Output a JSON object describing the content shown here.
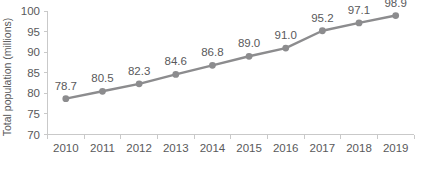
{
  "chart_data": {
    "type": "line",
    "title": "",
    "subtitle": "",
    "xlabel": "",
    "ylabel": "Total population (millions)",
    "categories": [
      "2010",
      "2011",
      "2012",
      "2013",
      "2014",
      "2015",
      "2016",
      "2017",
      "2018",
      "2019"
    ],
    "values": [
      78.7,
      80.5,
      82.3,
      84.6,
      86.8,
      89.0,
      91.0,
      95.2,
      97.1,
      98.9
    ],
    "point_labels": [
      "78.7",
      "80.5",
      "82.3",
      "84.6",
      "86.8",
      "89.0",
      "91.0",
      "95.2",
      "97.1",
      "98.9"
    ],
    "ylim": [
      70,
      100
    ],
    "y_ticks": [
      70,
      75,
      80,
      85,
      90,
      95,
      100
    ],
    "y_tick_labels": [
      "70",
      "75",
      "80",
      "85",
      "90",
      "95",
      "100"
    ],
    "grid": false,
    "legend": null,
    "legend_position": "none",
    "series": [
      {
        "name": "Total population",
        "values": [
          78.7,
          80.5,
          82.3,
          84.6,
          86.8,
          89.0,
          91.0,
          95.2,
          97.1,
          98.9
        ]
      }
    ],
    "colors": {
      "line": "#8c8c8e",
      "marker": "#8c8c8e",
      "axis": "#c9c9c9",
      "text": "#59595b",
      "background": "#ffffff"
    }
  }
}
